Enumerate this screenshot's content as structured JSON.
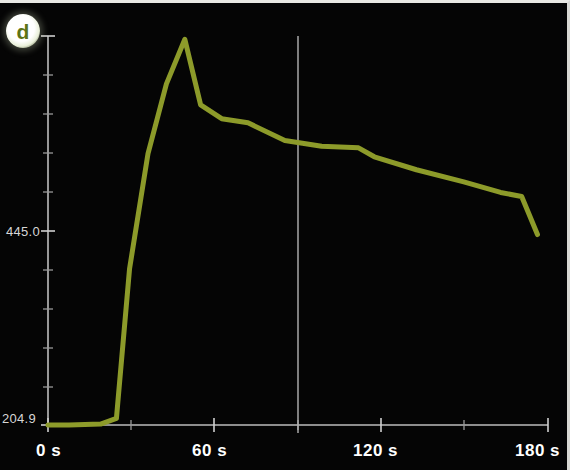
{
  "panel": {
    "badge_label": "d",
    "background_color": "#050505",
    "line_color": "#8d9b2a",
    "axis_color": "#bdbdbd",
    "reference_line_color": "#b4b4b4"
  },
  "axes": {
    "y_tick_labels": [
      "204.9",
      "445.0"
    ],
    "y_top_label": "0",
    "x_tick_labels": [
      "0 s",
      "60 s",
      "120 s",
      "180 s"
    ]
  },
  "chart_data": {
    "type": "line",
    "title": "d",
    "xlabel": "",
    "ylabel": "",
    "xlim": [
      0,
      190
    ],
    "ylim": [
      204.9,
      685.1
    ],
    "yticks": [
      204.9,
      445.0,
      685.1
    ],
    "ytick_labels": [
      "204.9",
      "445.0",
      "685.1"
    ],
    "xticks": [
      0,
      60,
      120,
      180
    ],
    "xtick_labels": [
      "0 s",
      "60 s",
      "120 s",
      "180 s"
    ],
    "grid": false,
    "legend": "none",
    "annotations": [
      {
        "type": "vertical-reference-line",
        "x": 90,
        "color": "#b4b4b4"
      }
    ],
    "series": [
      {
        "name": "signal",
        "color": "#8d9b2a",
        "x": [
          0,
          8,
          20,
          26,
          31,
          38,
          45,
          52,
          58,
          66,
          76,
          90,
          104,
          118,
          124,
          140,
          158,
          172,
          180,
          186
        ],
        "y": [
          204.9,
          204.9,
          206.0,
          213.0,
          398.0,
          540.0,
          626.0,
          681.0,
          600.0,
          583.0,
          578.0,
          556.0,
          549.0,
          547.0,
          536.0,
          520.0,
          505.0,
          492.0,
          487.0,
          440.0
        ]
      }
    ]
  }
}
